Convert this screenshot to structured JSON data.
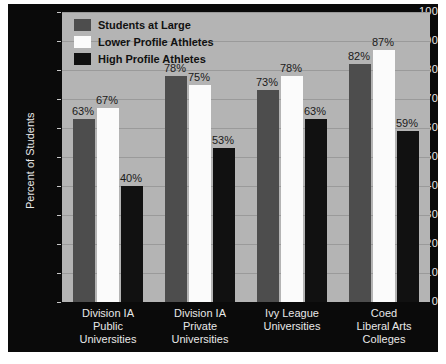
{
  "chart_data": {
    "type": "bar",
    "title": "",
    "xlabel": "",
    "ylabel": "Percent of Students",
    "ylim": [
      0,
      100
    ],
    "ytick_step": 10,
    "yticks": [
      "100",
      "90",
      "80",
      "70",
      "60",
      "50",
      "40",
      "30",
      "20",
      "10",
      "0"
    ],
    "grid": true,
    "legend_position": "top-left inside plot",
    "categories": [
      "Division IA\nPublic\nUniversities",
      "Division IA\nPrivate\nUniversities",
      "Ivy League\nUniversities",
      "Coed\nLiberal Arts\nColleges"
    ],
    "series": [
      {
        "name": "Students at Large",
        "color": "#4d4d4d",
        "values": [
          63,
          78,
          73,
          82
        ],
        "labels": [
          "63%",
          "78%",
          "73%",
          "82%"
        ]
      },
      {
        "name": "Lower Profile Athletes",
        "color": "#fbfbfb",
        "values": [
          67,
          75,
          78,
          87
        ],
        "labels": [
          "67%",
          "75%",
          "78%",
          "87%"
        ]
      },
      {
        "name": "High Profile Athletes",
        "color": "#111111",
        "values": [
          40,
          53,
          63,
          59
        ],
        "labels": [
          "40%",
          "53%",
          "63%",
          "59%"
        ]
      }
    ]
  },
  "style": {
    "figure_background": "#ffffff",
    "canvas_background": "#0a0a0a",
    "plot_background": "#b4b4b4",
    "gridline_color": "#9a9a9a",
    "tick_label_color": "#e8e8e8",
    "value_label_color": "#1a1a1a",
    "legend_text_color": "#111111"
  }
}
